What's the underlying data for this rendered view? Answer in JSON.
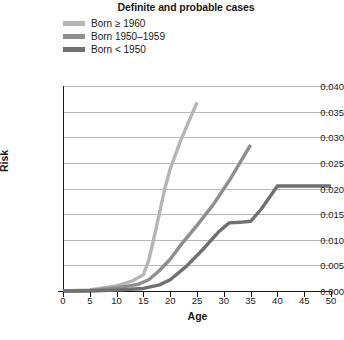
{
  "chart_data": {
    "type": "line",
    "title": "Definite and probable cases",
    "xlabel": "Age",
    "ylabel": "Risk",
    "xlim": [
      0,
      50
    ],
    "ylim": [
      0,
      0.04
    ],
    "xticks": [
      0,
      5,
      10,
      15,
      20,
      25,
      30,
      35,
      40,
      45,
      50
    ],
    "xtick_labels": [
      "0",
      "5",
      "10",
      "15",
      "20",
      "25",
      "30",
      "35",
      "40",
      "45",
      "50"
    ],
    "yticks": [
      0.0,
      0.005,
      0.01,
      0.015,
      0.02,
      0.025,
      0.03,
      0.035,
      0.04
    ],
    "ytick_labels": [
      "0.000",
      "0.005",
      "0.010",
      "0.015",
      "0.020",
      "0.025",
      "0.030",
      "0.035",
      "0.040"
    ],
    "grid": true,
    "legend_position": "top-left",
    "series": [
      {
        "name": "Born ≥ 1960",
        "color": "#b5b5b5",
        "x": [
          0,
          5,
          10,
          13,
          15,
          16,
          17,
          18,
          19,
          20,
          22,
          25
        ],
        "y": [
          0.0,
          0.0002,
          0.001,
          0.002,
          0.0032,
          0.006,
          0.0105,
          0.0152,
          0.02,
          0.0238,
          0.0295,
          0.0368
        ]
      },
      {
        "name": "Born 1950–1959",
        "color": "#8e8e8e",
        "x": [
          0,
          5,
          10,
          14,
          16,
          18,
          20,
          22,
          25,
          28,
          31,
          35
        ],
        "y": [
          0.0,
          0.0001,
          0.0006,
          0.0013,
          0.0022,
          0.004,
          0.0062,
          0.009,
          0.0128,
          0.0168,
          0.0215,
          0.0285
        ]
      },
      {
        "name": "Born < 1950",
        "color": "#707070",
        "x": [
          0,
          5,
          10,
          15,
          18,
          20,
          23,
          26,
          29,
          31,
          33,
          35,
          37,
          40,
          45,
          50
        ],
        "y": [
          0.0,
          0.0,
          0.0002,
          0.0005,
          0.0012,
          0.0022,
          0.0048,
          0.008,
          0.0115,
          0.0133,
          0.0134,
          0.0136,
          0.016,
          0.0205,
          0.0205,
          0.0205
        ]
      }
    ]
  },
  "legend": {
    "items": [
      {
        "label": "Born ≥ 1960"
      },
      {
        "label": "Born 1950–1959"
      },
      {
        "label": "Born < 1950"
      }
    ]
  }
}
